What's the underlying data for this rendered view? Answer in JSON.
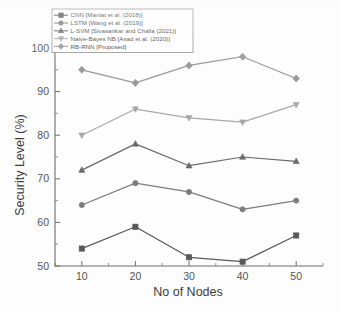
{
  "figure": {
    "background_color": "#ffffff",
    "axis_color": "#6e6e6e",
    "text_color": "#4a4a4a"
  },
  "axes": {
    "x_title": "No of Nodes",
    "y_title": "Security Level (%)",
    "x_ticklabels": [
      "10",
      "20",
      "30",
      "40",
      "50"
    ],
    "y_ticklabels": [
      "50",
      "60",
      "70",
      "80",
      "90",
      "100"
    ]
  },
  "legend": {
    "position": "top-left-inside",
    "entries": [
      {
        "label": "CNN [Maniat et al. (2018)]",
        "color": "#595959",
        "marker": "square"
      },
      {
        "label": "LSTM [Wang et al. (2019)]",
        "color": "#7d7d7d",
        "marker": "circle"
      },
      {
        "label": "L-SVM [Sivasankar and Challa (2021)]",
        "color": "#6b6b6b",
        "marker": "triangle"
      },
      {
        "label": "Naive-Bayes NB [Asad et al. (2020)]",
        "color": "#a9a9a9",
        "marker": "triangle-down"
      },
      {
        "label": "RB-RNN [Proposed]",
        "color": "#9a9a9a",
        "marker": "diamond"
      }
    ]
  },
  "chart_data": {
    "type": "line",
    "title": "",
    "subtitle": "",
    "xlabel": "No of Nodes",
    "ylabel": "Security Level (%)",
    "x": [
      10,
      20,
      30,
      40,
      50
    ],
    "xlim": [
      5,
      55
    ],
    "ylim": [
      50,
      100
    ],
    "xticks": [
      10,
      20,
      30,
      40,
      50
    ],
    "yticks": [
      50,
      60,
      70,
      80,
      90,
      100
    ],
    "grid": false,
    "legend_position": "upper left",
    "annotations": [],
    "series": [
      {
        "name": "CNN [Maniat et al. (2018)]",
        "values": [
          54,
          59,
          52,
          51,
          57
        ],
        "color": "#595959",
        "marker": "square"
      },
      {
        "name": "LSTM [Wang et al. (2019)]",
        "values": [
          64,
          69,
          67,
          63,
          65
        ],
        "color": "#7d7d7d",
        "marker": "circle"
      },
      {
        "name": "L-SVM [Sivasankar and Challa (2021)]",
        "values": [
          72,
          78,
          73,
          75,
          74
        ],
        "color": "#6b6b6b",
        "marker": "triangle"
      },
      {
        "name": "Naive-Bayes NB [Asad et al. (2020)]",
        "values": [
          80,
          86,
          84,
          83,
          87
        ],
        "color": "#a9a9a9",
        "marker": "triangle-down"
      },
      {
        "name": "RB-RNN [Proposed]",
        "values": [
          95,
          92,
          96,
          98,
          93
        ],
        "color": "#9a9a9a",
        "marker": "diamond"
      }
    ]
  }
}
